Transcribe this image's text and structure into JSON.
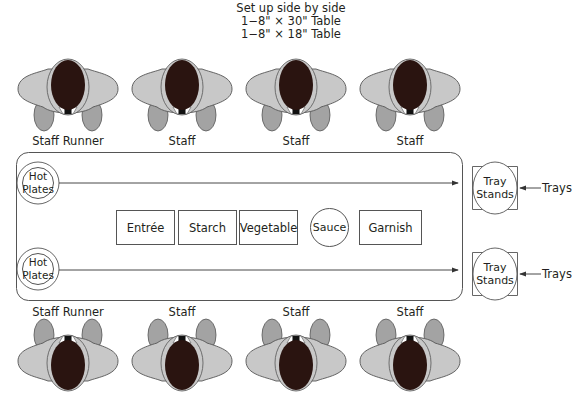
{
  "header": {
    "line1": "Set up side by side",
    "line2": "1−8\" × 30\" Table",
    "line3": "1−8\" × 18\" Table"
  },
  "top_row": [
    {
      "label": "Staff Runner"
    },
    {
      "label": "Staff"
    },
    {
      "label": "Staff"
    },
    {
      "label": "Staff"
    }
  ],
  "bottom_row": [
    {
      "label": "Staff Runner"
    },
    {
      "label": "Staff"
    },
    {
      "label": "Staff"
    },
    {
      "label": "Staff"
    }
  ],
  "table": {
    "hot_plates": [
      {
        "line1": "Hot",
        "line2": "Plates"
      },
      {
        "line1": "Hot",
        "line2": "Plates"
      }
    ],
    "stations": [
      {
        "label": "Entrée",
        "shape": "rect"
      },
      {
        "label": "Starch",
        "shape": "rect"
      },
      {
        "label": "Vegetable",
        "shape": "rect"
      },
      {
        "label": "Sauce",
        "shape": "circle"
      },
      {
        "label": "Garnish",
        "shape": "rect"
      }
    ]
  },
  "tray_stands": [
    {
      "line1": "Tray",
      "line2": "Stands",
      "input_label": "Trays"
    },
    {
      "line1": "Tray",
      "line2": "Stands",
      "input_label": "Trays"
    }
  ],
  "colors": {
    "shirt": "#c8c8c8",
    "hands": "#a3a3a3",
    "head": "#2a1410",
    "outline": "#555555"
  }
}
